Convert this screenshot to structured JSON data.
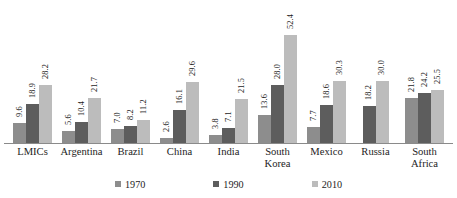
{
  "chart_data": {
    "type": "bar",
    "title": "",
    "subtitle": "",
    "xlabel": "",
    "ylabel": "",
    "ylim": [
      0,
      56
    ],
    "grid": false,
    "legend_position": "bottom",
    "orientation": "vertical",
    "group_mode": "grouped",
    "value_label_rotation": -90,
    "categories": [
      "LMICs",
      "Argentina",
      "Brazil",
      "China",
      "India",
      "South Korea",
      "Mexico",
      "Russia",
      "South Africa"
    ],
    "category_lines": [
      [
        "LMICs"
      ],
      [
        "Argentina"
      ],
      [
        "Brazil"
      ],
      [
        "China"
      ],
      [
        "India"
      ],
      [
        "South",
        "Korea"
      ],
      [
        "Mexico"
      ],
      [
        "Russia"
      ],
      [
        "South",
        "Africa"
      ]
    ],
    "series": [
      {
        "name": "1970",
        "color": "#8d8d8d",
        "values": [
          9.6,
          5.6,
          7.0,
          2.6,
          3.8,
          13.6,
          7.7,
          null,
          21.8
        ],
        "labels": [
          "9.6",
          "5.6",
          "7.0",
          "2.6",
          "3.8",
          "13.6",
          "7.7",
          "",
          "21.8"
        ]
      },
      {
        "name": "1990",
        "color": "#5d5d5d",
        "values": [
          18.9,
          10.4,
          8.2,
          16.1,
          7.1,
          28.0,
          18.6,
          18.2,
          24.2
        ],
        "labels": [
          "18.9",
          "10.4",
          "8.2",
          "16.1",
          "7.1",
          "28.0",
          "18.6",
          "18.2",
          "24.2"
        ]
      },
      {
        "name": "2010",
        "color": "#bcbcbc",
        "values": [
          28.2,
          21.7,
          11.2,
          29.6,
          21.5,
          52.4,
          30.3,
          30.0,
          25.5
        ],
        "labels": [
          "28.2",
          "21.7",
          "11.2",
          "29.6",
          "21.5",
          "52.4",
          "30.3",
          "30.0",
          "25.5"
        ]
      }
    ]
  },
  "legend": {
    "items": [
      {
        "label": "1970",
        "color": "#8d8d8d"
      },
      {
        "label": "1990",
        "color": "#5d5d5d"
      },
      {
        "label": "2010",
        "color": "#bcbcbc"
      }
    ]
  },
  "colors": {
    "background": "#ffffff",
    "axis_line": "#8a8a8a",
    "text": "#1d1d1d",
    "series_1970": "#8d8d8d",
    "series_1990": "#5d5d5d",
    "series_2010": "#bcbcbc"
  }
}
